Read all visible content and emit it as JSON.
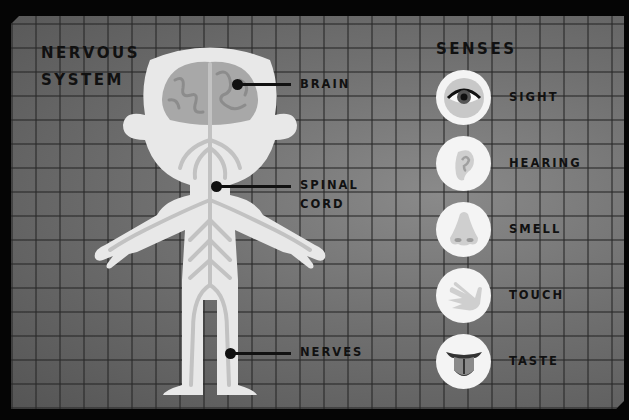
{
  "diagram": {
    "title_line1": "NERVOUS",
    "title_line2": "SYSTEM",
    "labels": {
      "brain": "BRAIN",
      "spinal_cord_line1": "SPINAL",
      "spinal_cord_line2": "CORD",
      "nerves": "NERVES"
    }
  },
  "senses": {
    "title": "SENSES",
    "items": [
      {
        "label": "SIGHT",
        "icon": "eye-icon"
      },
      {
        "label": "HEARING",
        "icon": "ear-icon"
      },
      {
        "label": "SMELL",
        "icon": "nose-icon"
      },
      {
        "label": "TOUCH",
        "icon": "hand-icon"
      },
      {
        "label": "TASTE",
        "icon": "tongue-icon"
      }
    ]
  },
  "colors": {
    "background": "#6e6e6e",
    "body": "#e8e8e8",
    "nerves": "#c2c2c2",
    "brain": "#a8a8a8",
    "text": "#111111"
  }
}
